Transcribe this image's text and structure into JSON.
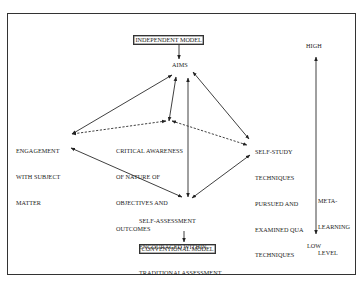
{
  "diagram": {
    "top_model": "INDEPENDENT MODEL",
    "bottom_model": "CONVENTIONAL MODEL",
    "nodes": {
      "aims": "AIMS",
      "engagement": [
        "ENGAGEMENT",
        "WITH SUBJECT",
        "MATTER"
      ],
      "critical": [
        "CRITICAL AWARENESS",
        "OF NATURE OF",
        "OBJECTIVES AND",
        "OUTCOMES"
      ],
      "self_study": [
        "SELF-STUDY",
        "TECHNIQUES",
        "PURSUED AND",
        "EXAMINED QUA",
        "TECHNIQUES"
      ],
      "self_assessment": [
        "SELF-ASSESSMENT",
        "ENCOURAGED WITHIN",
        "TRADITIONALASSESSMENT"
      ]
    },
    "scale": {
      "high": "HIGH",
      "low": "LOW",
      "label": [
        "META-",
        "LEARNING",
        "LEVEL"
      ]
    },
    "edges": [
      {
        "from": "independent-model",
        "to": "aims",
        "style": "solid",
        "direction": "forward"
      },
      {
        "from": "aims",
        "to": "engagement",
        "style": "solid",
        "direction": "both"
      },
      {
        "from": "aims",
        "to": "critical",
        "style": "solid",
        "direction": "both"
      },
      {
        "from": "self_assessment",
        "to": "aims",
        "style": "solid",
        "direction": "both"
      },
      {
        "from": "aims",
        "to": "self_study",
        "style": "solid",
        "direction": "both"
      },
      {
        "from": "critical",
        "to": "engagement",
        "style": "dashed",
        "direction": "both"
      },
      {
        "from": "critical",
        "to": "self_study",
        "style": "dashed",
        "direction": "both"
      },
      {
        "from": "engagement",
        "to": "self_assessment",
        "style": "solid",
        "direction": "both"
      },
      {
        "from": "self_study",
        "to": "self_assessment",
        "style": "solid",
        "direction": "both"
      },
      {
        "from": "self_assessment",
        "to": "conventional-model",
        "style": "solid",
        "direction": "forward"
      }
    ]
  }
}
